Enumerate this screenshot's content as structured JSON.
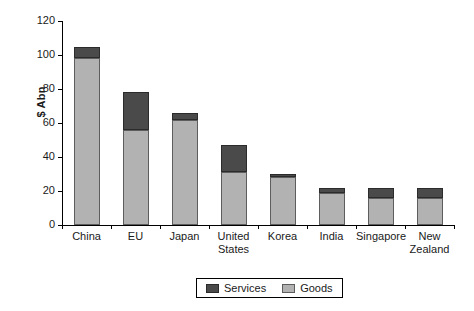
{
  "chart_data": {
    "type": "bar",
    "stacked": true,
    "title": "",
    "subtitle": "",
    "xlabel": "",
    "ylabel": "$ Abn",
    "ylim": [
      0,
      120
    ],
    "yticks": [
      0,
      20,
      40,
      60,
      80,
      100,
      120
    ],
    "ytick_labels": [
      "0",
      "20",
      "40",
      "60",
      "80",
      "100",
      "120"
    ],
    "grid": false,
    "legend_position": "bottom",
    "categories": [
      "China",
      "EU",
      "Japan",
      "United States",
      "Korea",
      "India",
      "Singapore",
      "New Zealand"
    ],
    "category_label_lines": [
      [
        "China"
      ],
      [
        "EU"
      ],
      [
        "Japan"
      ],
      [
        "United",
        "States"
      ],
      [
        "Korea"
      ],
      [
        "India"
      ],
      [
        "Singapore"
      ],
      [
        "New",
        "Zealand"
      ]
    ],
    "series": [
      {
        "name": "Goods",
        "color": "#b2b2b2",
        "values": [
          98,
          56,
          62,
          31,
          28,
          19,
          16,
          16
        ]
      },
      {
        "name": "Services",
        "color": "#4a4a4a",
        "values": [
          7,
          22,
          4,
          16,
          2,
          3,
          6,
          6
        ]
      }
    ],
    "totals": [
      105,
      78,
      66,
      47,
      30,
      22,
      22,
      22
    ],
    "legend_entries": [
      {
        "label": "Services",
        "color": "#4a4a4a"
      },
      {
        "label": "Goods",
        "color": "#b2b2b2"
      }
    ]
  }
}
